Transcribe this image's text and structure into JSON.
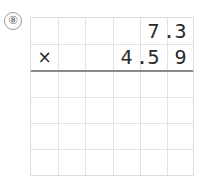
{
  "problem": {
    "number_label": "⑧",
    "operator": "×",
    "multiplicand": {
      "text": "7.3",
      "digits": [
        "7",
        "3"
      ],
      "decimal_point": "."
    },
    "multiplier": {
      "text": "4.59",
      "digits": [
        "4",
        "5",
        "9"
      ],
      "decimal_point": "."
    },
    "grid": {
      "columns": 6,
      "rows": 6,
      "answer_rows_blank": 4
    }
  },
  "colors": {
    "grid_line": "#e2e2e2",
    "rule_line": "#8a8a8a",
    "text": "#2a2a2a"
  }
}
